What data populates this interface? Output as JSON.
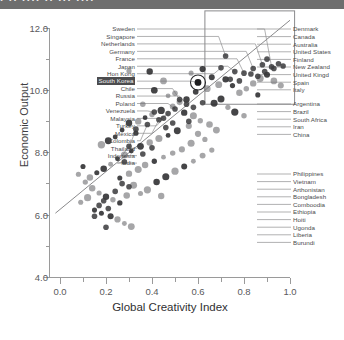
{
  "top_banner_fragment": "· ·· ···· ·· ··· ····",
  "axes": {
    "x_title": "Global Creativity Index",
    "y_title": "Economic Output",
    "x_ticks": [
      "0.0",
      "0.2",
      "0.4",
      "0.6",
      "0.8",
      "1.0"
    ],
    "y_ticks": [
      "4.0",
      "6.0",
      "8.0",
      "10.0",
      "12.0"
    ]
  },
  "chart_data": {
    "type": "scatter",
    "title": "",
    "xlabel": "Global Creativity Index",
    "ylabel": "Economic Output",
    "xlim": [
      -0.05,
      1.05
    ],
    "ylim": [
      4.0,
      12.6
    ],
    "grid": false,
    "legend": false,
    "xticks": [
      0.0,
      0.2,
      0.4,
      0.6,
      0.8,
      1.0
    ],
    "yticks": [
      4.0,
      6.0,
      8.0,
      10.0,
      12.0
    ],
    "trendline": {
      "x0": -0.02,
      "y0": 6.05,
      "x1": 1.0,
      "y1": 12.25
    },
    "highlight": {
      "label": "South Korea",
      "x": 0.6,
      "y": 10.25,
      "marker": "circled"
    },
    "annotation_box": {
      "x0": 0.63,
      "y0": 9.55,
      "x1": 1.02,
      "y1": 12.55
    },
    "points": [
      {
        "label": "Sweden",
        "x": 0.92,
        "y": 10.75
      },
      {
        "label": "Singapore",
        "x": 0.72,
        "y": 11.1
      },
      {
        "label": "Netherlands",
        "x": 0.88,
        "y": 10.82
      },
      {
        "label": "Germany",
        "x": 0.84,
        "y": 10.7
      },
      {
        "label": "France",
        "x": 0.8,
        "y": 10.55
      },
      {
        "label": "Japan",
        "x": 0.76,
        "y": 10.6
      },
      {
        "label": "Hon Kong",
        "x": 0.7,
        "y": 10.72
      },
      {
        "label": "South Korea",
        "x": 0.6,
        "y": 10.25
      },
      {
        "label": "Chile",
        "x": 0.52,
        "y": 9.7
      },
      {
        "label": "Russia",
        "x": 0.55,
        "y": 9.55
      },
      {
        "label": "Poland",
        "x": 0.5,
        "y": 9.4
      },
      {
        "label": "Venezuela",
        "x": 0.41,
        "y": 9.3
      },
      {
        "label": "Malaysia",
        "x": 0.47,
        "y": 9.25
      },
      {
        "label": "Turkey",
        "x": 0.45,
        "y": 9.1
      },
      {
        "label": "Mexico",
        "x": 0.43,
        "y": 9.05
      },
      {
        "label": "Colombia",
        "x": 0.38,
        "y": 8.9
      },
      {
        "label": "Thailand",
        "x": 0.33,
        "y": 8.75
      },
      {
        "label": "Indonesia",
        "x": 0.3,
        "y": 8.2
      },
      {
        "label": "India",
        "x": 0.28,
        "y": 7.7
      },
      {
        "label": "Denmark",
        "x": 0.95,
        "y": 10.85
      },
      {
        "label": "Canada",
        "x": 0.93,
        "y": 10.7
      },
      {
        "label": "Australia",
        "x": 0.97,
        "y": 10.78
      },
      {
        "label": "United States",
        "x": 0.9,
        "y": 11.0
      },
      {
        "label": "Finland",
        "x": 0.89,
        "y": 10.6
      },
      {
        "label": "New Zealand",
        "x": 0.86,
        "y": 10.45
      },
      {
        "label": "United Kingdom",
        "x": 0.83,
        "y": 10.52
      },
      {
        "label": "Spain",
        "x": 0.78,
        "y": 10.3
      },
      {
        "label": "Italy",
        "x": 0.74,
        "y": 10.35
      },
      {
        "label": "Argentina",
        "x": 0.62,
        "y": 9.6
      },
      {
        "label": "Brazil",
        "x": 0.58,
        "y": 9.45
      },
      {
        "label": "South Africa",
        "x": 0.56,
        "y": 9.0
      },
      {
        "label": "Iran",
        "x": 0.49,
        "y": 8.95
      },
      {
        "label": "China",
        "x": 0.46,
        "y": 8.8
      },
      {
        "label": "Philippines",
        "x": 0.4,
        "y": 8.15
      },
      {
        "label": "Vietnam",
        "x": 0.36,
        "y": 7.95
      },
      {
        "label": "Afghanistan",
        "x": 0.24,
        "y": 6.75
      },
      {
        "label": "Bangladesh",
        "x": 0.27,
        "y": 7.0
      },
      {
        "label": "Cambodia",
        "x": 0.3,
        "y": 6.9
      },
      {
        "label": "Ethiopia",
        "x": 0.19,
        "y": 6.45
      },
      {
        "label": "Haiti",
        "x": 0.17,
        "y": 6.3
      },
      {
        "label": "Uganda",
        "x": 0.21,
        "y": 6.2
      },
      {
        "label": "Liberia",
        "x": 0.15,
        "y": 5.95
      },
      {
        "label": "Burundi",
        "x": 0.2,
        "y": 5.6
      }
    ],
    "unlabeled_cloud": [
      [
        0.3,
        10.62
      ],
      [
        0.39,
        10.6
      ],
      [
        0.45,
        10.3
      ],
      [
        0.41,
        10.0
      ],
      [
        0.36,
        9.55
      ],
      [
        0.47,
        9.82
      ],
      [
        0.5,
        9.9
      ],
      [
        0.52,
        9.62
      ],
      [
        0.55,
        9.7
      ],
      [
        0.49,
        9.48
      ],
      [
        0.44,
        9.35
      ],
      [
        0.4,
        9.22
      ],
      [
        0.37,
        9.12
      ],
      [
        0.34,
        9.0
      ],
      [
        0.3,
        8.95
      ],
      [
        0.33,
        8.62
      ],
      [
        0.27,
        8.72
      ],
      [
        0.24,
        8.5
      ],
      [
        0.21,
        8.38
      ],
      [
        0.18,
        8.25
      ],
      [
        0.57,
        10.55
      ],
      [
        0.62,
        10.68
      ],
      [
        0.66,
        10.42
      ],
      [
        0.69,
        10.18
      ],
      [
        0.64,
        10.05
      ],
      [
        0.59,
        9.95
      ],
      [
        0.54,
        9.28
      ],
      [
        0.58,
        9.18
      ],
      [
        0.61,
        9.02
      ],
      [
        0.56,
        8.85
      ],
      [
        0.51,
        8.7
      ],
      [
        0.47,
        8.55
      ],
      [
        0.43,
        8.45
      ],
      [
        0.39,
        8.32
      ],
      [
        0.35,
        8.2
      ],
      [
        0.31,
        8.05
      ],
      [
        0.28,
        7.92
      ],
      [
        0.25,
        7.8
      ],
      [
        0.22,
        7.62
      ],
      [
        0.19,
        7.48
      ],
      [
        0.16,
        7.35
      ],
      [
        0.13,
        7.2
      ],
      [
        0.11,
        7.05
      ],
      [
        0.14,
        6.85
      ],
      [
        0.17,
        6.7
      ],
      [
        0.2,
        6.58
      ],
      [
        0.23,
        6.48
      ],
      [
        0.26,
        6.38
      ],
      [
        0.29,
        6.62
      ],
      [
        0.32,
        6.95
      ],
      [
        0.12,
        6.55
      ],
      [
        0.09,
        6.4
      ],
      [
        0.15,
        6.15
      ],
      [
        0.18,
        6.05
      ],
      [
        0.22,
        5.95
      ],
      [
        0.25,
        5.85
      ],
      [
        0.28,
        5.72
      ],
      [
        0.31,
        5.62
      ],
      [
        0.1,
        7.55
      ],
      [
        0.08,
        7.3
      ],
      [
        0.72,
        10.35
      ],
      [
        0.75,
        10.15
      ],
      [
        0.78,
        9.92
      ],
      [
        0.81,
        10.05
      ],
      [
        0.84,
        10.22
      ],
      [
        0.87,
        10.38
      ],
      [
        0.9,
        10.5
      ],
      [
        0.93,
        10.3
      ],
      [
        0.96,
        10.15
      ],
      [
        0.86,
        9.85
      ],
      [
        0.7,
        9.72
      ],
      [
        0.67,
        9.58
      ],
      [
        0.73,
        9.45
      ],
      [
        0.76,
        9.3
      ],
      [
        0.8,
        9.18
      ],
      [
        0.65,
        8.9
      ],
      [
        0.68,
        8.72
      ],
      [
        0.6,
        8.6
      ],
      [
        0.63,
        8.42
      ],
      [
        0.57,
        8.3
      ],
      [
        0.53,
        8.1
      ],
      [
        0.49,
        7.98
      ],
      [
        0.45,
        7.85
      ],
      [
        0.41,
        7.72
      ],
      [
        0.37,
        7.6
      ],
      [
        0.34,
        7.45
      ],
      [
        0.3,
        7.32
      ],
      [
        0.26,
        7.18
      ],
      [
        0.42,
        7.05
      ],
      [
        0.46,
        7.22
      ],
      [
        0.5,
        7.4
      ],
      [
        0.54,
        7.55
      ],
      [
        0.58,
        7.72
      ],
      [
        0.62,
        7.9
      ],
      [
        0.66,
        8.08
      ],
      [
        0.38,
        6.8
      ],
      [
        0.35,
        6.68
      ],
      [
        0.44,
        6.6
      ]
    ]
  },
  "label_columns": {
    "left": [
      "Sweden",
      "Singapore",
      "Netherlands",
      "Germany",
      "France",
      "Japan",
      "Hon Kong",
      "South Korea",
      "Chile",
      "Russia",
      "Poland",
      "Venezuela",
      "Malaysia",
      "Turkey",
      "Mexico",
      "Colombia",
      "Thailand",
      "Indonesia",
      "India"
    ],
    "right_top": [
      "Denmark",
      "Canada",
      "Australia",
      "United States",
      "Finland",
      "New Zealand",
      "United Kingd",
      "Spain",
      "Italy"
    ],
    "right_mid": [
      "Argentina",
      "Brazil",
      "South Africa",
      "Iran",
      "China"
    ],
    "right_bottom": [
      "Philippines",
      "Vietnam",
      "Arthonistan",
      "Bongladesh",
      "Comboodia",
      "Ethiopia",
      "Hoiti",
      "Ugonda",
      "Liberia",
      "Burundi"
    ]
  }
}
